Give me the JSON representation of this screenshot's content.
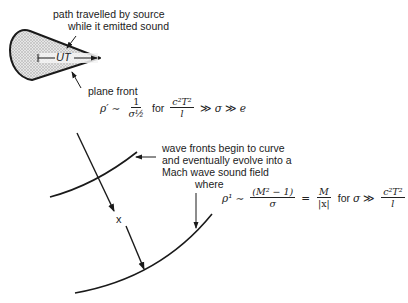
{
  "labels": {
    "path_line1": "path travelled by source",
    "path_line2": "while it emitted sound",
    "ut": "UT",
    "plane_front": "plane front",
    "wave_line1": "wave fronts begin to curve",
    "wave_line2": "and eventually evolve into a",
    "wave_line3": "Mach wave sound field",
    "where": "where",
    "x_label": "x"
  },
  "formula1": {
    "lhs": "ρ′",
    "sim": "∼",
    "num": "1",
    "den": "σ½",
    "for": "for",
    "cond_num": "c²T²",
    "cond_den": "l",
    "cond_rel1": "≫",
    "sigma": "σ",
    "cond_rel2": "≫",
    "e": "e"
  },
  "formula2": {
    "lhs": "ρ¹",
    "sim": "∼",
    "num": "(M² − 1)",
    "den": "σ",
    "eq": "=",
    "num2": "M",
    "den2": "|x|",
    "for": "for",
    "sigma": "σ",
    "rel": "≫",
    "cond_num": "c²T²",
    "cond_den": "l"
  },
  "colors": {
    "stroke": "#1a1a1a",
    "shade": "#c8c8c8"
  }
}
